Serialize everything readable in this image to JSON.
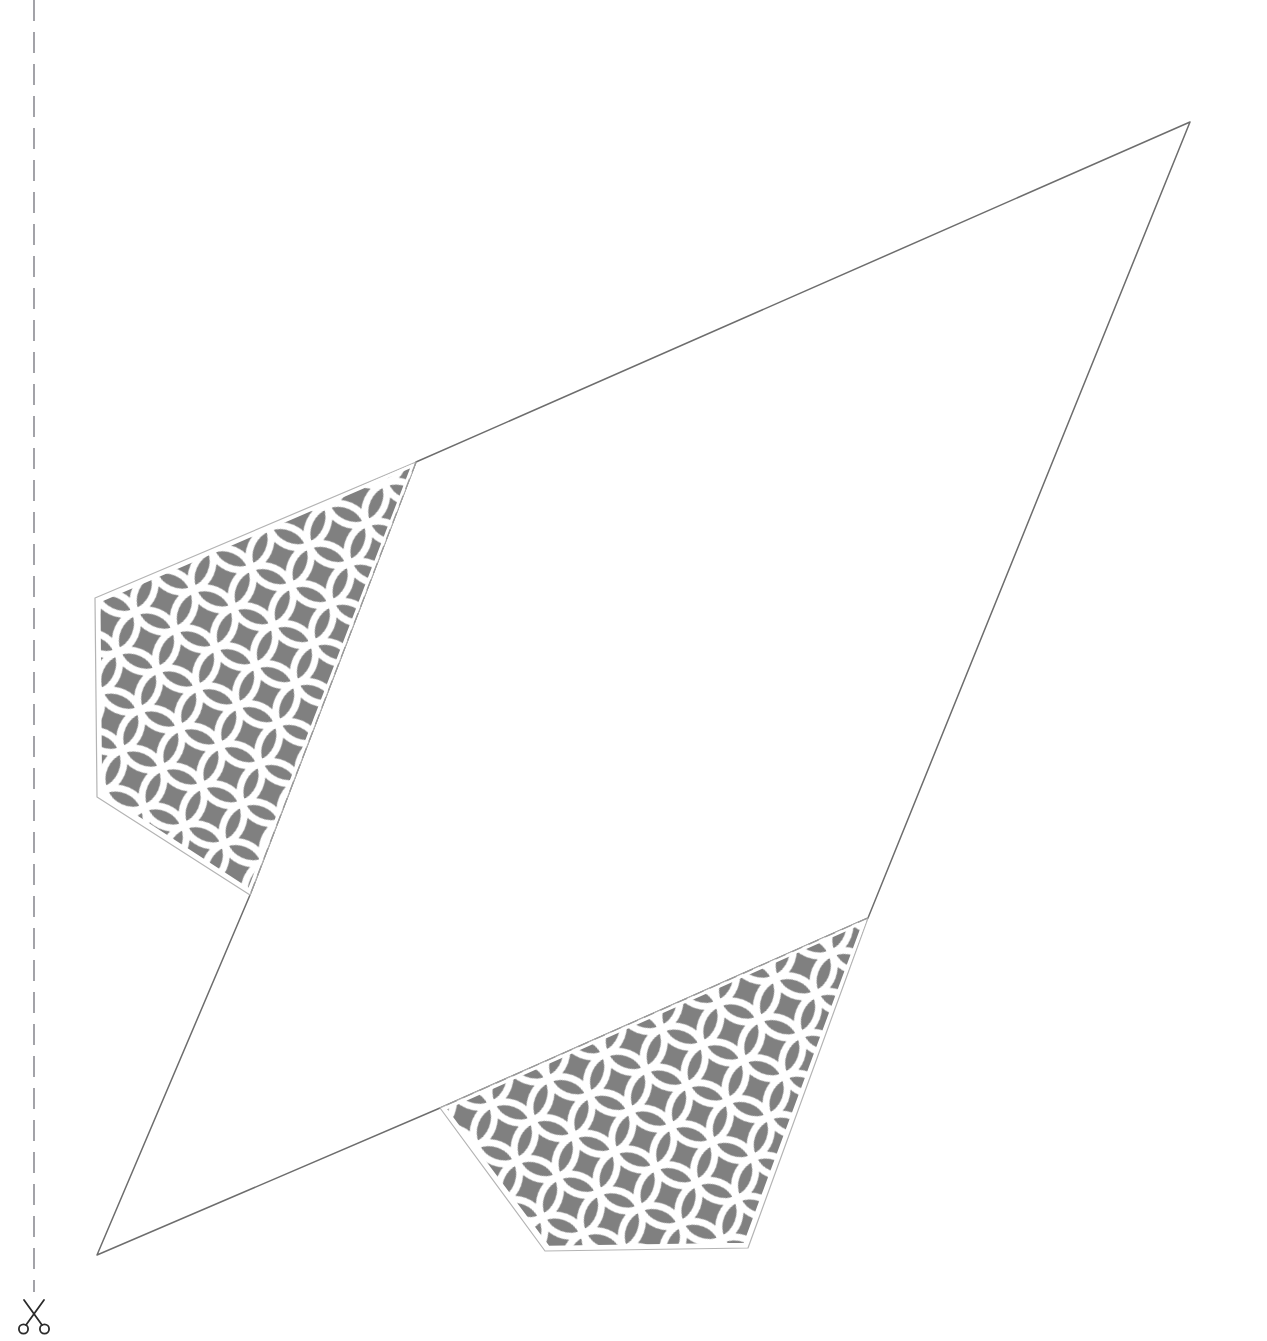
{
  "document": {
    "kind": "papercraft-cutout-template",
    "title": "Papercraft Cut-Out Template",
    "page_width": 1267,
    "page_height": 1341,
    "background_color": "#ffffff"
  },
  "colors": {
    "paper": "#ffffff",
    "outline_stroke": "#6d6d6d",
    "fold_dash_stroke": "#9a9a9a",
    "cut_dash_stroke": "#8c8c93",
    "pattern_fill": "#808080",
    "pattern_line": "#ffffff",
    "tab_border": "#b4b4b4",
    "scissors_stroke": "#2b2b2b"
  },
  "cut_guide": {
    "name": "cut-here-line",
    "orientation": "vertical",
    "x": 34,
    "y_start": 0,
    "y_end": 1292,
    "dash_length": 21,
    "gap_length": 11,
    "stroke_width": 1.6,
    "icon": "scissors-icon",
    "icon_center_x": 34,
    "icon_center_y": 1316
  },
  "shapes": {
    "main_body": {
      "name": "main-panel-outline",
      "label": "Main panel",
      "stroke_width": 1.5,
      "fill": "#ffffff",
      "points": [
        [
          1190,
          122
        ],
        [
          416,
          462
        ],
        [
          250,
          895
        ],
        [
          97,
          1255
        ],
        [
          440,
          1108
        ],
        [
          868,
          918
        ]
      ]
    },
    "tabs": [
      {
        "name": "glue-tab-upper",
        "label": "Upper glue tab",
        "pattern": "shippo-overlapping-circles",
        "points": [
          [
            416,
            462
          ],
          [
            250,
            895
          ],
          [
            97,
            797
          ],
          [
            95,
            598
          ]
        ],
        "fold_edge": [
          [
            416,
            462
          ],
          [
            250,
            895
          ]
        ],
        "border_width": 5,
        "pattern_scale": 62,
        "pattern_rotation": -21
      },
      {
        "name": "glue-tab-lower",
        "label": "Lower glue tab",
        "pattern": "shippo-overlapping-circles",
        "points": [
          [
            868,
            918
          ],
          [
            440,
            1108
          ],
          [
            545,
            1251
          ],
          [
            748,
            1248
          ]
        ],
        "fold_edge": [
          [
            868,
            918
          ],
          [
            440,
            1108
          ]
        ],
        "border_width": 5,
        "pattern_scale": 62,
        "pattern_rotation": -24
      }
    ]
  },
  "pattern": {
    "name": "shippo-overlapping-circles",
    "display_name": "Shippo overlapping circles",
    "background": "#808080",
    "line_color": "#ffffff",
    "tile_size": 62,
    "circle_radius": 31,
    "line_width": 7
  },
  "fold_lines": [
    {
      "name": "fold-line-upper-tab",
      "from": [
        416,
        462
      ],
      "to": [
        250,
        895
      ],
      "dash_length": 11,
      "gap_length": 7,
      "stroke_width": 1.2
    },
    {
      "name": "fold-line-lower-tab",
      "from": [
        868,
        918
      ],
      "to": [
        440,
        1108
      ],
      "dash_length": 11,
      "gap_length": 7,
      "stroke_width": 1.2
    }
  ]
}
